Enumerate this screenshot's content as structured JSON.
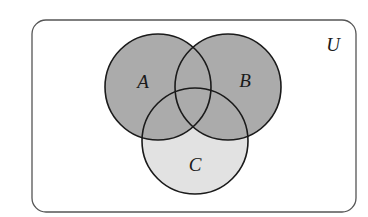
{
  "diagram": {
    "type": "venn",
    "universe": {
      "label": "U",
      "rect": {
        "x": 32,
        "y": 20,
        "width": 324,
        "height": 192,
        "rx": 14
      },
      "label_pos": {
        "x": 333,
        "y": 51
      },
      "stroke": "#555555"
    },
    "sets": [
      {
        "label": "A",
        "cx": 158,
        "cy": 87,
        "r": 53,
        "label_pos": {
          "x": 143,
          "y": 88
        }
      },
      {
        "label": "B",
        "cx": 228,
        "cy": 87,
        "r": 53,
        "label_pos": {
          "x": 245,
          "y": 87
        }
      },
      {
        "label": "C",
        "cx": 195,
        "cy": 141,
        "r": 53,
        "label_pos": {
          "x": 195,
          "y": 171
        }
      }
    ],
    "shading": {
      "shaded_region": "A ∪ B",
      "shaded_fill": "#ababab",
      "c_only_fill": "#e2e2e2",
      "outline": "#1a1a1a"
    }
  }
}
